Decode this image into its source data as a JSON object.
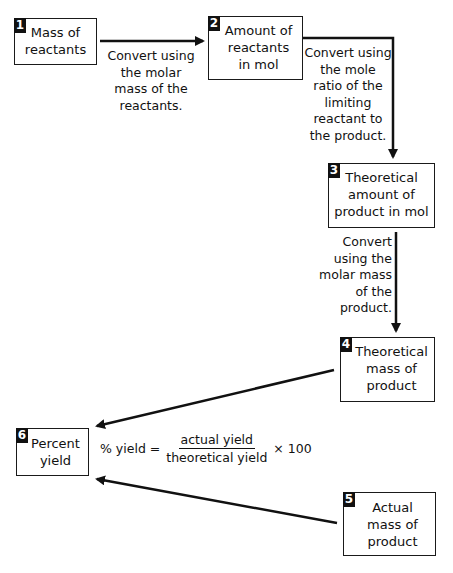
{
  "diagram": {
    "type": "flowchart",
    "colors": {
      "line": "#111111",
      "badge_bg": "#111111",
      "badge_text": "#ffffff",
      "background": "#ffffff"
    },
    "boxes": [
      {
        "id": "1",
        "number": "1",
        "label": "Mass of\nreactants"
      },
      {
        "id": "2",
        "number": "2",
        "label": "Amount of\nreactants\nin mol"
      },
      {
        "id": "3",
        "number": "3",
        "label": "Theoretical\namount of\nproduct in mol"
      },
      {
        "id": "4",
        "number": "4",
        "label": "Theoretical\nmass of\nproduct"
      },
      {
        "id": "5",
        "number": "5",
        "label": "Actual\nmass of\nproduct"
      },
      {
        "id": "6",
        "number": "6",
        "label": "Percent\nyield"
      }
    ],
    "edges": [
      {
        "from": "1",
        "to": "2",
        "label": "Convert using\nthe molar\nmass of the\nreactants."
      },
      {
        "from": "2",
        "to": "3",
        "label": "Convert using\nthe mole\nratio of the\nlimiting\nreactant to\nthe product."
      },
      {
        "from": "3",
        "to": "4",
        "label": "Convert\nusing the\nmolar mass\nof the\nproduct."
      },
      {
        "from": "4",
        "to": "6",
        "label": ""
      },
      {
        "from": "5",
        "to": "6",
        "label": ""
      }
    ],
    "formula": {
      "lhs": "% yield =",
      "numerator": "actual yield",
      "denominator": "theoretical yield",
      "multiplier": "× 100"
    }
  }
}
